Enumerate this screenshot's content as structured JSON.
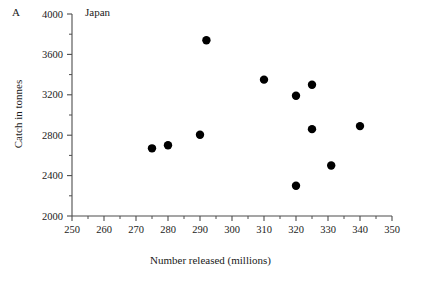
{
  "figure": {
    "panel_label": "A",
    "title": "Japan"
  },
  "chart_data": {
    "type": "scatter",
    "title": "Japan",
    "panel_label": "A",
    "xlabel": "Number released (millions)",
    "ylabel": "Catch in tonnes",
    "xlim": [
      250,
      350
    ],
    "ylim": [
      2000,
      4000
    ],
    "xticks": [
      250,
      260,
      270,
      280,
      290,
      300,
      310,
      320,
      330,
      340,
      350
    ],
    "xtick_labels": [
      "250",
      "260",
      "270",
      "280",
      "290",
      "300",
      "310",
      "320",
      "330",
      "340",
      "350"
    ],
    "x_minor_step": 5,
    "yticks": [
      2000,
      2400,
      2800,
      3200,
      3600,
      4000
    ],
    "ytick_labels": [
      "2000",
      "2400",
      "2800",
      "3200",
      "3600",
      "4000"
    ],
    "y_minor_step": 200,
    "grid": false,
    "legend": false,
    "marker": "circle",
    "marker_color": "#000000",
    "marker_size": 4.2,
    "points": [
      {
        "x": 275,
        "y": 2670
      },
      {
        "x": 280,
        "y": 2700
      },
      {
        "x": 290,
        "y": 2805
      },
      {
        "x": 292,
        "y": 3740
      },
      {
        "x": 310,
        "y": 3350
      },
      {
        "x": 320,
        "y": 3190
      },
      {
        "x": 320,
        "y": 2300
      },
      {
        "x": 325,
        "y": 3300
      },
      {
        "x": 325,
        "y": 2860
      },
      {
        "x": 331,
        "y": 2500
      },
      {
        "x": 340,
        "y": 2890
      }
    ]
  }
}
